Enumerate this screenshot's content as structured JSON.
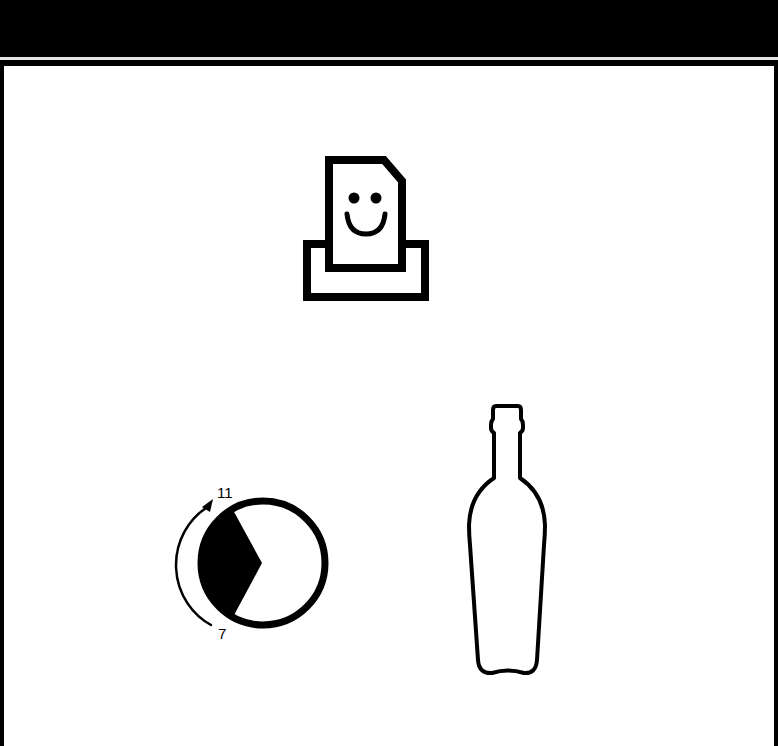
{
  "header": {
    "background": "#000000",
    "rule_color": "#e6e6e6"
  },
  "canvas": {
    "background": "#ffffff",
    "icons": [
      {
        "name": "happy-document-tray-icon",
        "description": "smiling document page sitting in a tray"
      },
      {
        "name": "timer-dial-icon",
        "description": "circle with dark sector and curved arrow from 7 to 11"
      },
      {
        "name": "bottle-icon",
        "description": "outline of a wine bottle"
      }
    ]
  },
  "dial": {
    "start_label": "7",
    "end_label": "11"
  },
  "colors": {
    "ink": "#000000",
    "paper": "#ffffff"
  }
}
